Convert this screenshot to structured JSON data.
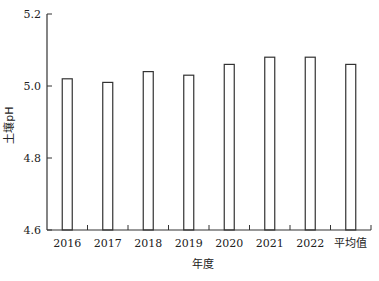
{
  "chart_data": {
    "type": "bar",
    "title": "",
    "xlabel": "年度",
    "ylabel": "土壤pH",
    "categories": [
      "2016",
      "2017",
      "2018",
      "2019",
      "2020",
      "2021",
      "2022",
      "平均值"
    ],
    "values": [
      5.02,
      5.01,
      5.04,
      5.03,
      5.06,
      5.08,
      5.08,
      5.06
    ],
    "ylim": [
      4.6,
      5.2
    ],
    "yticks": [
      4.6,
      4.8,
      5.0,
      5.2
    ],
    "ytick_labels": [
      "4.6",
      "4.8",
      "5.0",
      "5.2"
    ],
    "grid": false,
    "legend": null,
    "bar_style": {
      "fill": "#ffffff",
      "stroke": "#333333"
    }
  },
  "axis": {
    "x_title": "年度",
    "y_title": "土壤pH",
    "y_title_main": "土壤",
    "y_title_sub": "pH"
  }
}
